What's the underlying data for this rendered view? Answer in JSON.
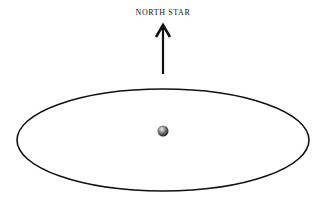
{
  "diagram": {
    "label": "NORTH STAR",
    "arrow": {
      "x": 163,
      "y_tip": 25,
      "y_base": 75,
      "color": "#111111"
    },
    "orbit": {
      "cx": 163,
      "cy": 140,
      "rx": 146,
      "ry": 52,
      "stroke": "#111111"
    },
    "body": {
      "cx": 163,
      "cy": 131,
      "r": 6
    }
  }
}
